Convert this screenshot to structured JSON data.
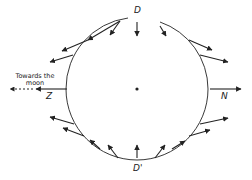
{
  "diagram": {
    "title": "",
    "center": {
      "x": 137,
      "y": 89
    },
    "circle": {
      "rx": 71,
      "ry": 71
    },
    "labels": {
      "top": "D",
      "bottom": "D'",
      "left": "Z",
      "right": "N",
      "moon_line1": "Towards the",
      "moon_line2": "moon"
    },
    "colors": {
      "stroke": "#222222",
      "background": "#ffffff"
    },
    "arrows": [
      {
        "x1": 137,
        "y1": 22,
        "x2": 137,
        "y2": 36
      },
      {
        "x1": 120,
        "y1": 21,
        "x2": 110,
        "y2": 35
      },
      {
        "x1": 120,
        "y1": 21,
        "x2": 88,
        "y2": 40
      },
      {
        "x1": 88,
        "y1": 40,
        "x2": 62,
        "y2": 51
      },
      {
        "x1": 73,
        "y1": 55,
        "x2": 50,
        "y2": 62
      },
      {
        "x1": 67,
        "y1": 89,
        "x2": 36,
        "y2": 89
      },
      {
        "x1": 74,
        "y1": 124,
        "x2": 50,
        "y2": 117
      },
      {
        "x1": 84,
        "y1": 136,
        "x2": 63,
        "y2": 128
      },
      {
        "x1": 100,
        "y1": 149,
        "x2": 90,
        "y2": 140
      },
      {
        "x1": 118,
        "y1": 158,
        "x2": 108,
        "y2": 145
      },
      {
        "x1": 137,
        "y1": 158,
        "x2": 137,
        "y2": 145
      },
      {
        "x1": 155,
        "y1": 158,
        "x2": 165,
        "y2": 145
      },
      {
        "x1": 172,
        "y1": 149,
        "x2": 185,
        "y2": 141
      },
      {
        "x1": 189,
        "y1": 136,
        "x2": 210,
        "y2": 130
      },
      {
        "x1": 200,
        "y1": 124,
        "x2": 228,
        "y2": 118
      },
      {
        "x1": 210,
        "y1": 89,
        "x2": 241,
        "y2": 89
      },
      {
        "x1": 200,
        "y1": 55,
        "x2": 228,
        "y2": 62
      },
      {
        "x1": 189,
        "y1": 40,
        "x2": 212,
        "y2": 50
      },
      {
        "x1": 160,
        "y1": 26,
        "x2": 166,
        "y2": 36
      }
    ],
    "dashed_arrow": {
      "x1": 33,
      "y1": 89,
      "x2": 10,
      "y2": 89
    }
  }
}
